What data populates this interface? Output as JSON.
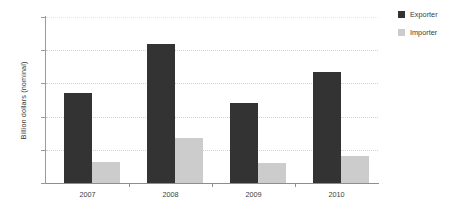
{
  "chart_data": {
    "type": "bar",
    "title": "",
    "xlabel": "",
    "ylabel": "Billion dollars (nominal)",
    "categories": [
      "2007",
      "2008",
      "2009",
      "2010"
    ],
    "series": [
      {
        "name": "Exporter",
        "color": "#333333",
        "values": [
          270,
          420,
          240,
          333
        ]
      },
      {
        "name": "Importer",
        "color": "#cccccc",
        "values": [
          63,
          135,
          60,
          80
        ]
      }
    ],
    "ylim": [
      0,
      500
    ],
    "yticks": [
      0,
      100,
      200,
      300,
      400,
      500
    ],
    "ytick_labels": [
      "0",
      "100",
      "200",
      "300",
      "400",
      "500"
    ],
    "grid": true,
    "grid_axis": "y",
    "legend_position": "right-top"
  },
  "legend": {
    "items": [
      {
        "label": "Exporter",
        "color": "#333333"
      },
      {
        "label": "Importer",
        "color": "#cccccc"
      }
    ]
  },
  "axes": {
    "y_title": "Billion dollars (nominal)"
  }
}
